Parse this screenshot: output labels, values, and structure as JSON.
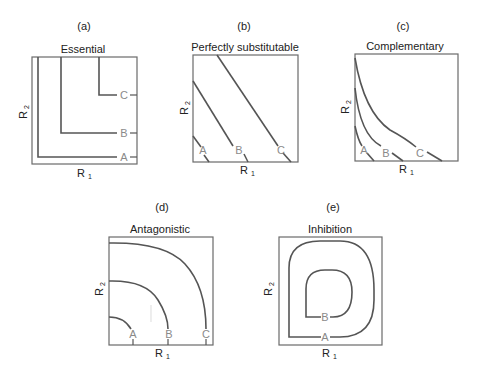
{
  "panels": [
    {
      "id": "(a)",
      "title": "Essential",
      "xlabel": "R",
      "xsub": "1",
      "ylabel": "R",
      "ysub": "2",
      "curves": [
        "A",
        "B",
        "C"
      ]
    },
    {
      "id": "(b)",
      "title": "Perfectly substitutable",
      "xlabel": "R",
      "xsub": "1",
      "ylabel": "R",
      "ysub": "2",
      "curves": [
        "A",
        "B",
        "C"
      ]
    },
    {
      "id": "(c)",
      "title": "Complementary",
      "xlabel": "R",
      "xsub": "1",
      "ylabel": "R",
      "ysub": "2",
      "curves": [
        "A",
        "B",
        "C"
      ]
    },
    {
      "id": "(d)",
      "title": "Antagonistic",
      "xlabel": "R",
      "xsub": "1",
      "ylabel": "R",
      "ysub": "2",
      "curves": [
        "A",
        "B",
        "C"
      ]
    },
    {
      "id": "(e)",
      "title": "Inhibition",
      "xlabel": "R",
      "xsub": "1",
      "ylabel": "R",
      "ysub": "2",
      "curves": [
        "A",
        "B"
      ]
    }
  ],
  "colors": {
    "frame": "#6a6a6a",
    "curve": "#555555",
    "curve_label": "#8a8a8a"
  }
}
